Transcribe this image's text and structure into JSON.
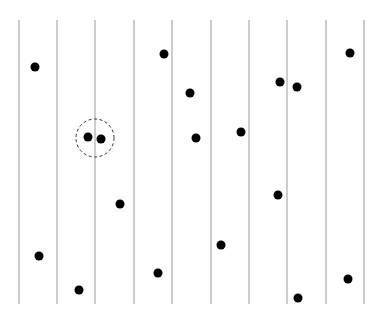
{
  "diagram": {
    "width": 380,
    "height": 321,
    "line_color": "#9a9a9a",
    "dot_color": "#000000",
    "lines": {
      "x": [
        19,
        57,
        95,
        134,
        172,
        211,
        249,
        287,
        326,
        364
      ],
      "y_top": 20,
      "y_bottom": 304
    },
    "dot_radius": 4.5,
    "dots": [
      {
        "x": 35,
        "y": 67
      },
      {
        "x": 164,
        "y": 54
      },
      {
        "x": 190,
        "y": 93
      },
      {
        "x": 88,
        "y": 137
      },
      {
        "x": 101,
        "y": 139
      },
      {
        "x": 196,
        "y": 138
      },
      {
        "x": 241,
        "y": 132
      },
      {
        "x": 280,
        "y": 82
      },
      {
        "x": 297,
        "y": 87
      },
      {
        "x": 350,
        "y": 53
      },
      {
        "x": 120,
        "y": 204
      },
      {
        "x": 278,
        "y": 195
      },
      {
        "x": 39,
        "y": 256
      },
      {
        "x": 79,
        "y": 290
      },
      {
        "x": 158,
        "y": 273
      },
      {
        "x": 221,
        "y": 245
      },
      {
        "x": 298,
        "y": 298
      },
      {
        "x": 348,
        "y": 279
      }
    ],
    "highlight_circle": {
      "cx": 95,
      "cy": 138,
      "r": 19,
      "style": "dashed"
    }
  }
}
